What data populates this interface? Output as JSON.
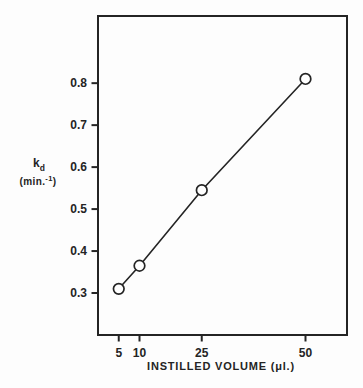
{
  "chart_data": {
    "type": "scatter",
    "line_through_points": true,
    "x": [
      5,
      10,
      25,
      50
    ],
    "y": [
      0.31,
      0.365,
      0.545,
      0.81
    ],
    "title": "",
    "xlabel": "INSTILLED VOLUME (μl.)",
    "ylabel": "k_d (min.^-1)",
    "ylabel_main": "k",
    "ylabel_sub": "d",
    "ylabel_units_pre": "(min.",
    "ylabel_units_sup": "-1",
    "ylabel_units_post": ")",
    "x_ticks": [
      5,
      10,
      25,
      50
    ],
    "x_tick_labels": [
      "5",
      "10",
      "25",
      "50"
    ],
    "y_ticks": [
      0.3,
      0.4,
      0.5,
      0.6,
      0.7,
      0.8
    ],
    "y_tick_labels": [
      "0.3",
      "0.4",
      "0.5",
      "0.6",
      "0.7",
      "0.8"
    ],
    "xlim": [
      0,
      60
    ],
    "ylim": [
      0.2,
      0.96
    ],
    "grid": false,
    "legend": null,
    "marker": "open-circle",
    "ink_color": "#242424",
    "background": "#fdfdfd"
  }
}
